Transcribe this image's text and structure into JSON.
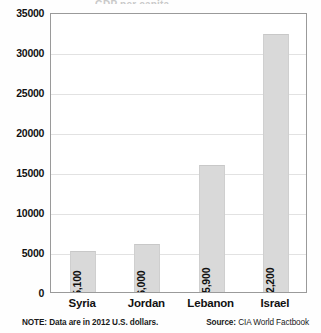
{
  "chart_data": {
    "type": "bar",
    "title": "",
    "xlabel": "",
    "ylabel": "",
    "ylim": [
      0,
      35000
    ],
    "grid": true,
    "legend": "none",
    "orientation": "vertical",
    "categories": [
      "Syria",
      "Jordan",
      "Lebanon",
      "Israel"
    ],
    "values": [
      5100,
      6000,
      15900,
      32200
    ],
    "data_labels": [
      "$5,100",
      "$6,000",
      "$15,900",
      "$32,200"
    ],
    "ytick_labels": [
      "35000",
      "30000",
      "25000",
      "20000",
      "15000",
      "10000",
      "5000",
      "0"
    ],
    "ytick_values": [
      35000,
      30000,
      25000,
      20000,
      15000,
      10000,
      5000,
      0
    ],
    "bar_color": "#d9d9d9",
    "grid_color": "#e2e2e2",
    "axis_color": "#9a9a9a",
    "text_color": "#111111"
  },
  "title_sliver": "GDP per capita",
  "footer": {
    "note": "NOTE: Data are in 2012 U.S. dollars.",
    "source_label": "Source:",
    "source_value": "CIA World Factbook"
  }
}
